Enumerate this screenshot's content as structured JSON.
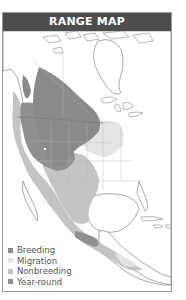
{
  "header": {
    "title": "RANGE MAP"
  },
  "legend": {
    "items": [
      {
        "label": "Breeding",
        "color": "#8a8a8a"
      },
      {
        "label": "Migration",
        "color": "#e4e4e4"
      },
      {
        "label": "Nonbreeding",
        "color": "#c4c4c4"
      },
      {
        "label": "Year-round",
        "color": "#8f8f8f"
      }
    ]
  },
  "colors": {
    "header_bg": "#4d4d4d",
    "frame_border": "#9a9a9a",
    "land_outline": "#6f6f6f",
    "border_lines": "#b5b5b5"
  }
}
